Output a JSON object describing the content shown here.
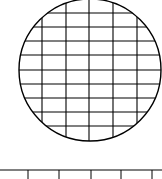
{
  "diagram": {
    "stroke_color": "#000000",
    "background": "#ffffff",
    "circle": {
      "cx": 90,
      "cy": 70,
      "r": 71
    },
    "grid": {
      "vertical_x": [
        42,
        66,
        89,
        113,
        137
      ],
      "horizontal_y": [
        13,
        27,
        41,
        55,
        70,
        84,
        98,
        112,
        126
      ]
    },
    "scale": {
      "line_y": 170,
      "tick_x": [
        28,
        59,
        91,
        121,
        152
      ]
    }
  }
}
